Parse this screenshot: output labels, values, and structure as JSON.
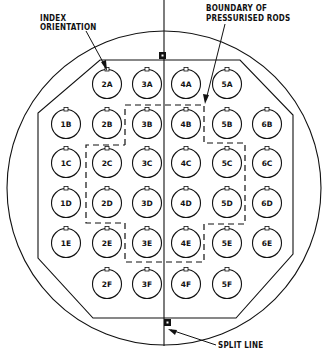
{
  "diagram": {
    "annotations": {
      "index_orientation": [
        "INDEX",
        "ORIENTATION"
      ],
      "boundary": [
        "BOUNDARY OF",
        "PRESSURISED RODS"
      ],
      "split_line": "SPLIT LINE"
    },
    "rods": [
      {
        "id": "2A",
        "label": "2A"
      },
      {
        "id": "3A",
        "label": "3A"
      },
      {
        "id": "4A",
        "label": "4A"
      },
      {
        "id": "5A",
        "label": "5A"
      },
      {
        "id": "1B",
        "label": "1B"
      },
      {
        "id": "2B",
        "label": "2B"
      },
      {
        "id": "3B",
        "label": "3B"
      },
      {
        "id": "4B",
        "label": "4B"
      },
      {
        "id": "5B",
        "label": "5B"
      },
      {
        "id": "6B",
        "label": "6B"
      },
      {
        "id": "1C",
        "label": "1C"
      },
      {
        "id": "2C",
        "label": "2C"
      },
      {
        "id": "3C",
        "label": "3C"
      },
      {
        "id": "4C",
        "label": "4C"
      },
      {
        "id": "5C",
        "label": "5C"
      },
      {
        "id": "6C",
        "label": "6C"
      },
      {
        "id": "1D",
        "label": "1D"
      },
      {
        "id": "2D",
        "label": "2D"
      },
      {
        "id": "3D",
        "label": "3D"
      },
      {
        "id": "4D",
        "label": "4D"
      },
      {
        "id": "5D",
        "label": "5D"
      },
      {
        "id": "6D",
        "label": "6D"
      },
      {
        "id": "1E",
        "label": "1E"
      },
      {
        "id": "2E",
        "label": "2E"
      },
      {
        "id": "3E",
        "label": "3E"
      },
      {
        "id": "4E",
        "label": "4E"
      },
      {
        "id": "5E",
        "label": "5E"
      },
      {
        "id": "6E",
        "label": "6E"
      },
      {
        "id": "2F",
        "label": "2F"
      },
      {
        "id": "3F",
        "label": "3F"
      },
      {
        "id": "4F",
        "label": "4F"
      },
      {
        "id": "5F",
        "label": "5F"
      }
    ],
    "pressurised_rods": [
      "3B",
      "4B",
      "2C",
      "3C",
      "4C",
      "5C",
      "2D",
      "3D",
      "4D",
      "5D",
      "3E",
      "4E"
    ]
  }
}
